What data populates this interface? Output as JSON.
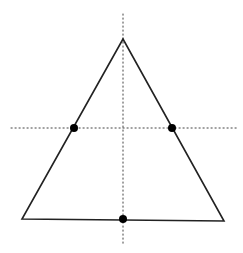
{
  "diagram": {
    "width": 243,
    "height": 253,
    "background": "#ffffff",
    "stroke_color": "#222222",
    "dot_color": "#000000",
    "triangle": {
      "apex": [
        123,
        39
      ],
      "base_left": [
        22,
        219
      ],
      "base_right": [
        224,
        221
      ],
      "stroke_width": 1.6
    },
    "axes": {
      "vertical": {
        "x": 123,
        "y1": 14,
        "y2": 245
      },
      "horizontal": {
        "y": 128,
        "x1": 11,
        "x2": 237
      },
      "dash": "1.2,2.8",
      "stroke_width": 1
    },
    "points": [
      {
        "name": "left-midpoint",
        "x": 74,
        "y": 128,
        "r": 4
      },
      {
        "name": "right-midpoint",
        "x": 172,
        "y": 128,
        "r": 4
      },
      {
        "name": "base-midpoint",
        "x": 123,
        "y": 219,
        "r": 4
      }
    ]
  }
}
